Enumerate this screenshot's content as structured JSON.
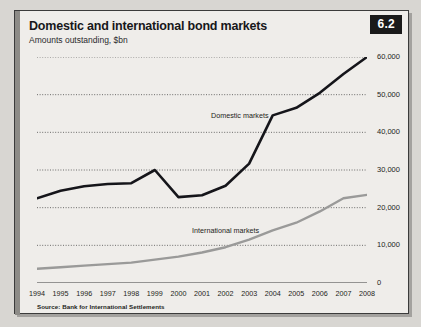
{
  "figure": {
    "number": "6.2",
    "title": "Domestic and international bond markets",
    "subtitle": "Amounts outstanding, $bn",
    "source": "Source: Bank for International Settlements"
  },
  "chart_data": {
    "type": "line",
    "title": "Domestic and international bond markets",
    "subtitle": "Amounts outstanding, $bn",
    "xlabel": "",
    "ylabel": "Amounts outstanding, $bn",
    "ylim": [
      0,
      60000
    ],
    "yticks": [
      0,
      10000,
      20000,
      30000,
      40000,
      50000,
      60000
    ],
    "ytick_labels": [
      "0",
      "10,000",
      "20,000",
      "30,000",
      "40,000",
      "50,000",
      "60,000"
    ],
    "grid": true,
    "legend_position": "inline-annotations",
    "categories": [
      1994,
      1995,
      1996,
      1997,
      1998,
      1999,
      2000,
      2001,
      2002,
      2003,
      2004,
      2005,
      2006,
      2007,
      2008
    ],
    "x": [
      "1994",
      "1995",
      "1996",
      "1997",
      "1998",
      "1999",
      "2000",
      "2001",
      "2002",
      "2003",
      "2004",
      "2005",
      "2006",
      "2007",
      "2008"
    ],
    "series": [
      {
        "name": "Domestic markets",
        "color": "#15151a",
        "values": [
          22500,
          24500,
          25700,
          26300,
          26500,
          30000,
          22800,
          23300,
          25800,
          31700,
          44500,
          46500,
          50500,
          55500,
          60000
        ]
      },
      {
        "name": "International markets",
        "color": "#9a9a99",
        "values": [
          3800,
          4200,
          4600,
          5000,
          5400,
          6200,
          7000,
          8100,
          9500,
          11500,
          14000,
          16000,
          19000,
          22500,
          23400
        ]
      }
    ],
    "annotations": [
      {
        "text": "Domestic markets",
        "x": 2002,
        "y": 43000
      },
      {
        "text": "International markets",
        "x": 2001,
        "y": 18000
      }
    ],
    "source": "Source: Bank for International Settlements"
  }
}
